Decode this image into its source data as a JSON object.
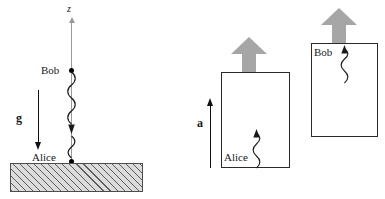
{
  "figure": {
    "width": 385,
    "height": 199,
    "background_color": "#ffffff"
  },
  "colors": {
    "ink": "#1a1a1a",
    "axis_gray": "#9a9a9a",
    "thrust_gray": "#a6a6a6",
    "ground_fill": "#dcdcdc",
    "ground_hatch": "#464646",
    "cabin_stroke": "#2b2b2b",
    "dot": "#000000"
  },
  "left_panel": {
    "name": "gravity-scenario",
    "axis": {
      "name": "z-axis",
      "label": "z",
      "direction": "up"
    },
    "observers": [
      {
        "name": "bob",
        "label": "Bob",
        "position": "upper",
        "marker": "dot"
      },
      {
        "name": "alice",
        "label": "Alice",
        "position": "ground-level",
        "marker": "dot"
      }
    ],
    "field_vector": {
      "name": "gravity-vector",
      "label": "g",
      "direction": "down"
    },
    "photons": [
      {
        "name": "photon-bob-to-alice",
        "from": "Bob",
        "to": "Alice",
        "direction": "down"
      }
    ],
    "ground": {
      "name": "ground-hatched",
      "pattern": "diagonal-hatch"
    }
  },
  "right_panel": {
    "name": "accelerated-rocket-scenario",
    "acceleration_vector": {
      "name": "acceleration-vector",
      "label": "a",
      "direction": "up"
    },
    "cabins": [
      {
        "name": "cabin-alice",
        "occupant_label": "Alice",
        "occupant_position": "bottom-left",
        "photon_direction": "up",
        "thrust": {
          "name": "thrust-arrow-alice",
          "direction": "up"
        }
      },
      {
        "name": "cabin-bob",
        "occupant_label": "Bob",
        "occupant_position": "top-left",
        "photon_direction": "up",
        "thrust": {
          "name": "thrust-arrow-bob",
          "direction": "up"
        }
      }
    ]
  }
}
